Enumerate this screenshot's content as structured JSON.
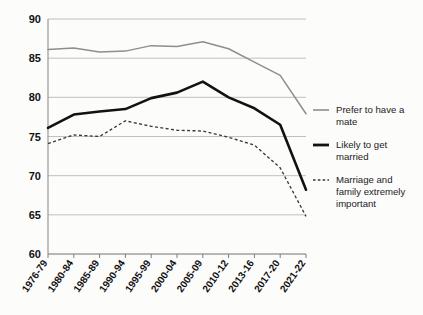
{
  "chart_data": {
    "type": "line",
    "title": "",
    "subtitle": "",
    "xlabel": "",
    "ylabel": "",
    "categories": [
      "1976-79",
      "1980-84",
      "1985-89",
      "1990-94",
      "1995-99",
      "2000-04",
      "2005-09",
      "2010-12",
      "2013-16",
      "2017-20",
      "2021-22"
    ],
    "ylim": [
      60,
      90
    ],
    "yticks": [
      60,
      65,
      70,
      75,
      80,
      85,
      90
    ],
    "ytick_labels": [
      "60",
      "65",
      "70",
      "75",
      "80",
      "85",
      "90"
    ],
    "grid": true,
    "legend_position": "right",
    "series": [
      {
        "name": "Prefer to have a mate",
        "style": "solid-thin-gray",
        "color": "#8e8e8e",
        "values": [
          86.1,
          86.3,
          85.8,
          85.9,
          86.6,
          86.5,
          87.1,
          86.2,
          84.5,
          82.8,
          77.9
        ]
      },
      {
        "name": "Likely to get married",
        "style": "solid-thick-black",
        "color": "#121212",
        "values": [
          76.1,
          77.8,
          78.2,
          78.5,
          79.9,
          80.6,
          82.0,
          80.0,
          78.6,
          76.5,
          68.2
        ]
      },
      {
        "name": "Marriage and family extremely important",
        "style": "dotted",
        "color": "#3a3a3a",
        "values": [
          74.1,
          75.2,
          75.0,
          77.0,
          76.3,
          75.8,
          75.7,
          74.9,
          73.9,
          71.0,
          64.8
        ]
      }
    ]
  },
  "legend": {
    "items": [
      {
        "label_line1": "Prefer to have a",
        "label_line2": "mate",
        "swatch": "line-gray-thin"
      },
      {
        "label_line1": "Likely to get",
        "label_line2": "married",
        "swatch": "line-black-thick"
      },
      {
        "label_line1": "Marriage and",
        "label_line2": "family extremely",
        "label_line3": "important",
        "swatch": "line-dotted"
      }
    ]
  },
  "colors": {
    "background": "#fcfcfb",
    "grid": "#b9b9b9",
    "axis": "#8f8f8f",
    "text": "#111111",
    "prefer": "#8e8e8e",
    "likely": "#121212",
    "important": "#3a3a3a"
  }
}
